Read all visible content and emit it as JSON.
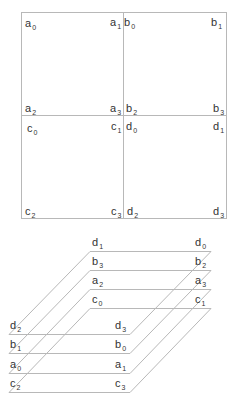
{
  "grid": {
    "quadrants": [
      {
        "name": "a",
        "corners": [
          "a0",
          "a1",
          "a2",
          "a3"
        ]
      },
      {
        "name": "b",
        "corners": [
          "b0",
          "b1",
          "b2",
          "b3"
        ]
      },
      {
        "name": "c",
        "corners": [
          "c0",
          "c1",
          "c2",
          "c3"
        ]
      },
      {
        "name": "d",
        "corners": [
          "d0",
          "d1",
          "d2",
          "d3"
        ]
      }
    ],
    "labels": [
      {
        "l": "a",
        "s": "0",
        "x": 25,
        "y": 27
      },
      {
        "l": "a",
        "s": "1",
        "x": 110,
        "y": 26
      },
      {
        "l": "b",
        "s": "0",
        "x": 124,
        "y": 26
      },
      {
        "l": "b",
        "s": "1",
        "x": 211,
        "y": 26
      },
      {
        "l": "a",
        "s": "2",
        "x": 25,
        "y": 112
      },
      {
        "l": "a",
        "s": "3",
        "x": 110,
        "y": 112
      },
      {
        "l": "b",
        "s": "2",
        "x": 126,
        "y": 112
      },
      {
        "l": "b",
        "s": "3",
        "x": 213,
        "y": 112
      },
      {
        "l": "c",
        "s": "0",
        "x": 27,
        "y": 132
      },
      {
        "l": "c",
        "s": "1",
        "x": 111,
        "y": 130
      },
      {
        "l": "d",
        "s": "0",
        "x": 126,
        "y": 130
      },
      {
        "l": "d",
        "s": "1",
        "x": 213,
        "y": 130
      },
      {
        "l": "c",
        "s": "2",
        "x": 25,
        "y": 215
      },
      {
        "l": "c",
        "s": "3",
        "x": 111,
        "y": 215
      },
      {
        "l": "d",
        "s": "2",
        "x": 127,
        "y": 215
      },
      {
        "l": "d",
        "s": "3",
        "x": 213,
        "y": 215
      }
    ]
  },
  "stack": {
    "layers": [
      {
        "back_left": {
          "l": "d",
          "s": "1"
        },
        "back_right": {
          "l": "d",
          "s": "0"
        },
        "front_left": {
          "l": "d",
          "s": "2"
        },
        "front_right": {
          "l": "d",
          "s": "3"
        }
      },
      {
        "back_left": {
          "l": "b",
          "s": "3"
        },
        "back_right": {
          "l": "b",
          "s": "2"
        },
        "front_left": {
          "l": "b",
          "s": "1"
        },
        "front_right": {
          "l": "b",
          "s": "0"
        }
      },
      {
        "back_left": {
          "l": "a",
          "s": "2"
        },
        "back_right": {
          "l": "a",
          "s": "3"
        },
        "front_left": {
          "l": "a",
          "s": "0"
        },
        "front_right": {
          "l": "a",
          "s": "1"
        }
      },
      {
        "back_left": {
          "l": "c",
          "s": "0"
        },
        "back_right": {
          "l": "c",
          "s": "1"
        },
        "front_left": {
          "l": "c",
          "s": "2"
        },
        "front_right": {
          "l": "c",
          "s": "3"
        }
      }
    ]
  },
  "colors": {
    "line": "#b8b8b8",
    "text": "#333333"
  }
}
